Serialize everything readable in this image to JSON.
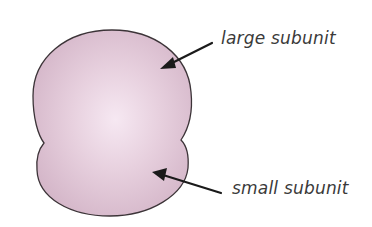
{
  "diagram": {
    "type": "ribosome",
    "colors": {
      "fill_center": "#f6e8f2",
      "fill_edge": "#d4b6c8",
      "outline": "#3c3438",
      "arrow": "#1a1a1a",
      "label_text": "#3a3a3a",
      "background": "#ffffff"
    },
    "labels": {
      "large": "large subunit",
      "small": "small subunit"
    },
    "arrows": [
      {
        "points_to": "large subunit",
        "from": [
          212,
          43
        ],
        "to": [
          160,
          69
        ]
      },
      {
        "points_to": "small subunit",
        "from": [
          221,
          193
        ],
        "to": [
          152,
          172
        ]
      }
    ]
  }
}
